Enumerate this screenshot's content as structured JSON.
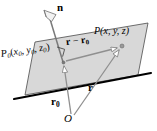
{
  "figure": {
    "colors": {
      "plane_fill": "#d8d8d8",
      "plane_edge": "#3c3c3c",
      "bold_edge": "#000000",
      "vector_line": "#8c8c8c",
      "normal_line": "#6e6e6e",
      "text": "#000000",
      "background": "#ffffff"
    },
    "labels": {
      "normal": "n",
      "point_P": "P",
      "point_P_coords": "(x, y, z)",
      "point_P0": "P",
      "point_P0_sub": "0",
      "point_P0_coords_open": "(",
      "point_P0_x": "x",
      "point_P0_x_sub": "0",
      "point_P0_comma1": ", ",
      "point_P0_y": "y",
      "point_P0_y_sub": "0",
      "point_P0_comma2": ", ",
      "point_P0_z": "z",
      "point_P0_z_sub": "0",
      "point_P0_coords_close": ")",
      "vector_r_minus_r0_r": "r",
      "vector_r_minus_r0_minus": " − ",
      "vector_r_minus_r0_r0": "r",
      "vector_r_minus_r0_r0_sub": "0",
      "vector_r": "r",
      "vector_r0": "r",
      "vector_r0_sub": "0",
      "origin": "O"
    },
    "geometry": {
      "plane_polygon": "35,42 148,23 138,75 25,95",
      "bold_edge_from": "14,99",
      "bold_edge_to": "151,73",
      "normal_tail": "63,62",
      "normal_head": "48,14",
      "r0_tail": "72,116",
      "r0_head": "63,62",
      "r_tail": "75,117",
      "r_head": "122,47",
      "diff_tail": "65,61",
      "diff_head": "120,47",
      "right_angle_marker": "at P0",
      "point_P_dot": "122,47",
      "point_P0_dot": "63,62"
    }
  }
}
